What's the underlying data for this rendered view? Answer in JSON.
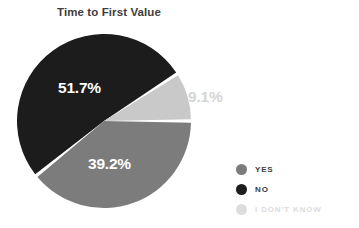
{
  "chart_data": {
    "type": "pie",
    "title": "Time to First Value",
    "categories": [
      "NO",
      "YES",
      "I DON'T KNOW"
    ],
    "values": [
      51.7,
      39.2,
      9.1
    ],
    "value_labels": [
      "51.7%",
      "39.2%",
      "9.1%"
    ],
    "unit": "percent",
    "legend_position": "right-bottom",
    "grid": false,
    "xlabel": "",
    "ylabel": "",
    "colors": {
      "no": "#1c1c1c",
      "yes": "#7c7c7c",
      "i_dont_know": "#c9c9c9",
      "background": "#ffffff",
      "title_text": "#3d3d3d",
      "slice_label_light": "#ffffff",
      "slice_label_muted": "#d5d5d5",
      "legend_text_dark": "#3d3d3d",
      "legend_text_muted": "#dcdcdc",
      "separator": "#ffffff"
    },
    "slices": [
      {
        "name": "NO",
        "label": "51.7%",
        "value": 51.7,
        "color": "#1c1c1c",
        "start_angle": 231.1,
        "end_angle": 417.2
      },
      {
        "name": "YES",
        "label": "39.2%",
        "value": 39.2,
        "color": "#7c7c7c",
        "start_angle": 90.0,
        "end_angle": 231.1
      },
      {
        "name": "I DON'T KNOW",
        "label": "9.1%",
        "value": 9.1,
        "color": "#c9c9c9",
        "start_angle": 57.2,
        "end_angle": 90.0
      }
    ]
  },
  "title": "Time to First Value",
  "labels": {
    "no": "51.7%",
    "yes": "39.2%",
    "i_dont_know": "9.1%"
  },
  "legend": {
    "items": [
      {
        "label": "YES",
        "color": "#7c7c7c",
        "text_color": "#3d3d3d"
      },
      {
        "label": "NO",
        "color": "#1c1c1c",
        "text_color": "#3d3d3d"
      },
      {
        "label": "I DON'T KNOW",
        "color": "#dcdcdc",
        "text_color": "#dcdcdc"
      }
    ]
  }
}
